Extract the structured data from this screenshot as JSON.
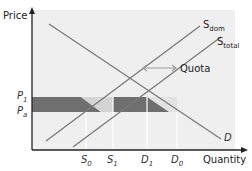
{
  "diagram": {
    "y_axis_label": "Price",
    "x_axis_label": "Quantity",
    "curves": {
      "domestic_supply": {
        "base": "S",
        "sub": "dom"
      },
      "total_supply": {
        "base": "S",
        "sub": "total"
      },
      "demand": {
        "label": "D"
      }
    },
    "annotation": {
      "quota_label": "Quota"
    },
    "price_ticks": [
      {
        "base": "P",
        "sub": "1"
      },
      {
        "base": "P",
        "sub": "a"
      }
    ],
    "quantity_ticks": [
      {
        "base": "S",
        "sub": "0"
      },
      {
        "base": "S",
        "sub": "1"
      },
      {
        "base": "D",
        "sub": "1"
      },
      {
        "base": "D",
        "sub": "0"
      }
    ],
    "colors": {
      "plot_background": "#efefef",
      "curve": "#7a7a7a",
      "shaded_area": "#6f6f6f",
      "light_shaded_area": "#dcdcdc",
      "quota_arrow": "#9a9a9a",
      "axis": "#222222"
    }
  }
}
